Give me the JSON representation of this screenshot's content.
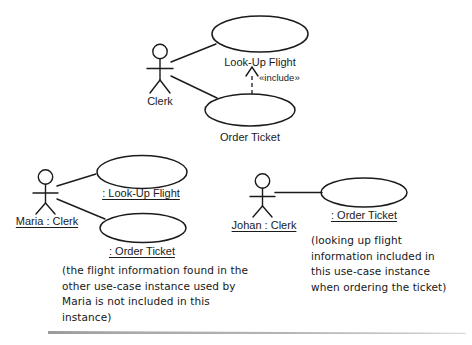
{
  "diagram": {
    "title_text": "",
    "stroke_color": "#1b1b1b",
    "background_color": "#ffffff",
    "rule_color": "#a9a9a9"
  },
  "type_level": {
    "actor_label": "Clerk",
    "usecases": [
      {
        "label": "Look-Up Flight"
      },
      {
        "label": "Order Ticket"
      }
    ],
    "dependency_label": "«include»"
  },
  "maria_instance": {
    "actor_label": "Maria : Clerk",
    "usecases": [
      {
        "label": ": Look-Up Flight"
      },
      {
        "label": ": Order Ticket"
      }
    ],
    "note": "(the flight information found in the\nother use-case instance used by\nMaria is not included in this\ninstance)"
  },
  "johan_instance": {
    "actor_label": "Johan : Clerk",
    "usecases": [
      {
        "label": ": Order Ticket"
      }
    ],
    "note": "(looking up flight\ninformation included in\nthis use-case instance\nwhen ordering the ticket)"
  }
}
